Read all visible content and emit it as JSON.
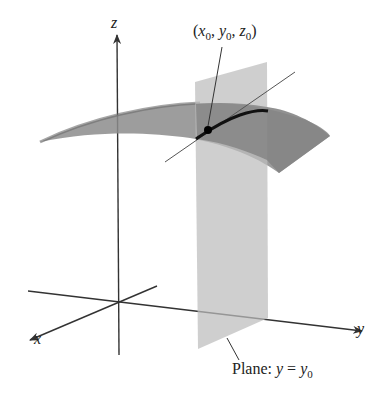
{
  "figure": {
    "axes": {
      "x_label": "x",
      "y_label": "y",
      "z_label": "z"
    },
    "point_label": {
      "open": "(",
      "x": "x",
      "x_sub": "0",
      "y": "y",
      "y_sub": "0",
      "z": "z",
      "z_sub": "0",
      "sep": ", ",
      "close": ")"
    },
    "plane_label": {
      "prefix": "Plane: ",
      "lhs": "y",
      "eq": " = ",
      "rhs": "y",
      "rhs_sub": "0"
    },
    "colors": {
      "axis": "#333333",
      "plane": "#bdbdbd",
      "surface": "#8c8c8c",
      "surface_dark": "#6a6a6a",
      "curve": "#111111"
    }
  }
}
